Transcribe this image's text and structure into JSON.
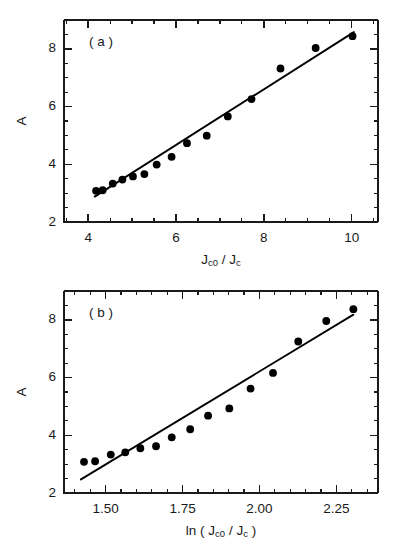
{
  "figure": {
    "background": "#ffffff",
    "ink_color": "#1a1a1a",
    "marker_color": "#000000"
  },
  "chart_data": [
    {
      "type": "scatter",
      "panel_tag": "( a )",
      "title": "",
      "xlabel": "J_c0 / J_c",
      "xlabel_parts": {
        "lead": "J",
        "lead_sub": "c0",
        "sep": " / ",
        "tail": "J",
        "tail_sub": "c"
      },
      "ylabel": "A",
      "xlim": [
        3.45,
        10.6
      ],
      "ylim": [
        2,
        9
      ],
      "xticks": [
        4,
        6,
        8,
        10
      ],
      "xticklabels": [
        "4",
        "6",
        "8",
        "10"
      ],
      "xminor_step": 0.5,
      "yticks": [
        2,
        4,
        6,
        8
      ],
      "yticklabels": [
        "2",
        "4",
        "6",
        "8"
      ],
      "yminor_step": 0.5,
      "grid": false,
      "legend": "none",
      "x": [
        4.18,
        4.33,
        4.56,
        4.78,
        5.02,
        5.28,
        5.56,
        5.9,
        6.25,
        6.7,
        7.18,
        7.72,
        8.38,
        9.18,
        10.02
      ],
      "y": [
        3.08,
        3.1,
        3.33,
        3.47,
        3.58,
        3.66,
        3.99,
        4.26,
        4.73,
        4.99,
        5.66,
        6.26,
        7.32,
        8.03,
        8.44
      ],
      "fit_line": {
        "x0": 4.15,
        "y0": 2.88,
        "x1": 10.05,
        "y1": 8.58
      }
    },
    {
      "type": "scatter",
      "panel_tag": "( b )",
      "title": "",
      "xlabel": "ln ( J_c0 / J_c )",
      "xlabel_parts": {
        "prefix": "ln (  ",
        "lead": "J",
        "lead_sub": "c0",
        "sep": " / ",
        "tail": "J",
        "tail_sub": "c",
        "suffix": " )"
      },
      "ylabel": "A",
      "xlim": [
        1.365,
        2.385
      ],
      "ylim": [
        2,
        9
      ],
      "xticks": [
        1.5,
        1.75,
        2.0,
        2.25
      ],
      "xticklabels": [
        "1.50",
        "1.75",
        "2.00",
        "2.25"
      ],
      "xminor_step": 0.05,
      "yticks": [
        2,
        4,
        6,
        8
      ],
      "yticklabels": [
        "2",
        "4",
        "6",
        "8"
      ],
      "yminor_step": 0.5,
      "grid": false,
      "legend": "none",
      "x": [
        1.43,
        1.466,
        1.517,
        1.564,
        1.613,
        1.664,
        1.715,
        1.775,
        1.833,
        1.902,
        1.971,
        2.044,
        2.126,
        2.217,
        2.305
      ],
      "y": [
        3.08,
        3.1,
        3.33,
        3.41,
        3.55,
        3.62,
        3.93,
        4.21,
        4.68,
        4.93,
        5.62,
        6.16,
        7.25,
        7.96,
        8.37
      ],
      "fit_line": {
        "x0": 1.42,
        "y0": 2.47,
        "x1": 2.305,
        "y1": 8.18
      }
    }
  ]
}
